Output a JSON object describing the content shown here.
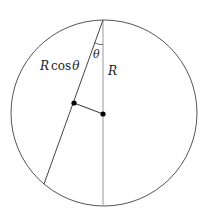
{
  "diagram": {
    "type": "geometry",
    "circle": {
      "cx": 104,
      "cy": 113,
      "r": 93,
      "stroke": "#555555"
    },
    "top_point": {
      "x": 103,
      "y": 20
    },
    "vertical_diameter": {
      "x1": 103,
      "y1": 20,
      "x2": 103,
      "y2": 206,
      "stroke": "#999999"
    },
    "chord": {
      "x1": 103,
      "y1": 20,
      "x2": 44,
      "y2": 184,
      "stroke": "#444444"
    },
    "perpendicular": {
      "x1": 74,
      "y1": 103,
      "x2": 103,
      "y2": 114,
      "stroke": "#333333"
    },
    "points": [
      {
        "name": "chord-midpoint",
        "x": 74,
        "y": 103
      },
      {
        "name": "center",
        "x": 103,
        "y": 114
      }
    ],
    "labels": {
      "chord_length_R": "R",
      "chord_length_cos": "cos",
      "chord_length_theta": "θ",
      "angle": "θ",
      "radius": "R"
    }
  }
}
